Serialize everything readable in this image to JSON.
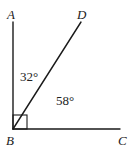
{
  "diagram": {
    "type": "angle-diagram",
    "points": {
      "A": {
        "label": "A",
        "x": 13,
        "y": 22,
        "label_x": 7,
        "label_y": 19
      },
      "B": {
        "label": "B",
        "x": 13,
        "y": 129,
        "label_x": 6,
        "label_y": 145
      },
      "C": {
        "label": "C",
        "x": 120,
        "y": 129,
        "label_x": 118,
        "label_y": 145
      },
      "D": {
        "label": "D",
        "x": 81,
        "y": 22,
        "label_x": 77,
        "label_y": 19
      }
    },
    "segments": [
      {
        "name": "segment-ba",
        "from": "B",
        "to": "A"
      },
      {
        "name": "segment-bd",
        "from": "B",
        "to": "D"
      },
      {
        "name": "segment-bc",
        "from": "B",
        "to": "C"
      }
    ],
    "right_angle_marker": {
      "vertex": "B",
      "size": 14
    },
    "angles": [
      {
        "name": "angle-abd",
        "text": "32°",
        "x": 20,
        "y": 81
      },
      {
        "name": "angle-dbc",
        "text": "58°",
        "x": 56,
        "y": 105
      }
    ],
    "colors": {
      "stroke": "#1a1a1a",
      "text": "#222222",
      "background": "#ffffff"
    }
  }
}
